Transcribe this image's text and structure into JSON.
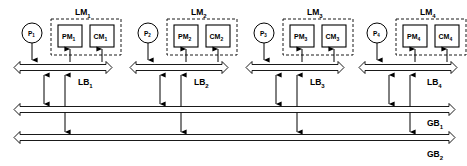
{
  "diagram": {
    "colors": {
      "stroke": "#000000",
      "background": "#ffffff",
      "fill": "#ffffff"
    },
    "clusters": [
      {
        "id": "cluster-1",
        "processor": {
          "base": "P",
          "sub": "1"
        },
        "module": {
          "base": "LM",
          "sub": "1"
        },
        "private_memory": {
          "base": "PM",
          "sub": "1"
        },
        "cache_memory": {
          "base": "CM",
          "sub": "1"
        },
        "local_bus": {
          "base": "LB",
          "sub": "1"
        }
      },
      {
        "id": "cluster-2",
        "processor": {
          "base": "P",
          "sub": "2"
        },
        "module": {
          "base": "LM",
          "sub": "2"
        },
        "private_memory": {
          "base": "PM",
          "sub": "2"
        },
        "cache_memory": {
          "base": "CM",
          "sub": "2"
        },
        "local_bus": {
          "base": "LB",
          "sub": "2"
        }
      },
      {
        "id": "cluster-3",
        "processor": {
          "base": "P",
          "sub": "3"
        },
        "module": {
          "base": "LM",
          "sub": "3"
        },
        "private_memory": {
          "base": "PM",
          "sub": "3"
        },
        "cache_memory": {
          "base": "CM",
          "sub": "3"
        },
        "local_bus": {
          "base": "LB",
          "sub": "3"
        }
      },
      {
        "id": "cluster-4",
        "processor": {
          "base": "P",
          "sub": "4"
        },
        "module": {
          "base": "LM",
          "sub": "4"
        },
        "private_memory": {
          "base": "PM",
          "sub": "4"
        },
        "cache_memory": {
          "base": "CM",
          "sub": "4"
        },
        "local_bus": {
          "base": "LB",
          "sub": "4"
        }
      }
    ],
    "global_buses": [
      {
        "id": "global-bus-1",
        "base": "GB",
        "sub": "1"
      },
      {
        "id": "global-bus-2",
        "base": "GB",
        "sub": "2"
      }
    ]
  }
}
